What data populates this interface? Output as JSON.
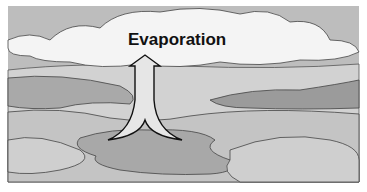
{
  "diagram": {
    "label": "Evaporation",
    "colors": {
      "sky": "#b9b9b9",
      "cloud": "#f4f4f4",
      "land": "#c9c9c9",
      "land_dark": "#9a9a9a",
      "water": "#aaaaaa",
      "arrow_fill": "#e6e6e6",
      "outline": "#333333"
    }
  }
}
